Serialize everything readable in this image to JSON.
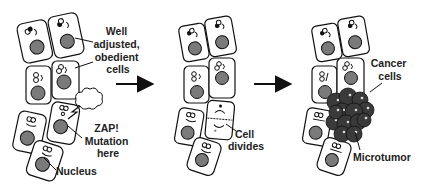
{
  "panels": [
    {
      "id": "normal",
      "labels": {
        "cells": [
          "Well",
          "adjusted,",
          "obedient",
          "cells"
        ],
        "mutation": [
          "ZAP!",
          "Mutation",
          "here"
        ],
        "nucleus": "Nucleus"
      }
    },
    {
      "id": "division",
      "labels": {
        "divides": [
          "Cell",
          "divides"
        ]
      }
    },
    {
      "id": "tumor",
      "labels": {
        "cancer": [
          "Cancer",
          "cells"
        ],
        "microtumor": "Microtumor"
      }
    }
  ],
  "colors": {
    "outline": "#111111",
    "nucleus": "#7a7a7a",
    "tumor": "#3a3a3a",
    "text": "#222222"
  }
}
